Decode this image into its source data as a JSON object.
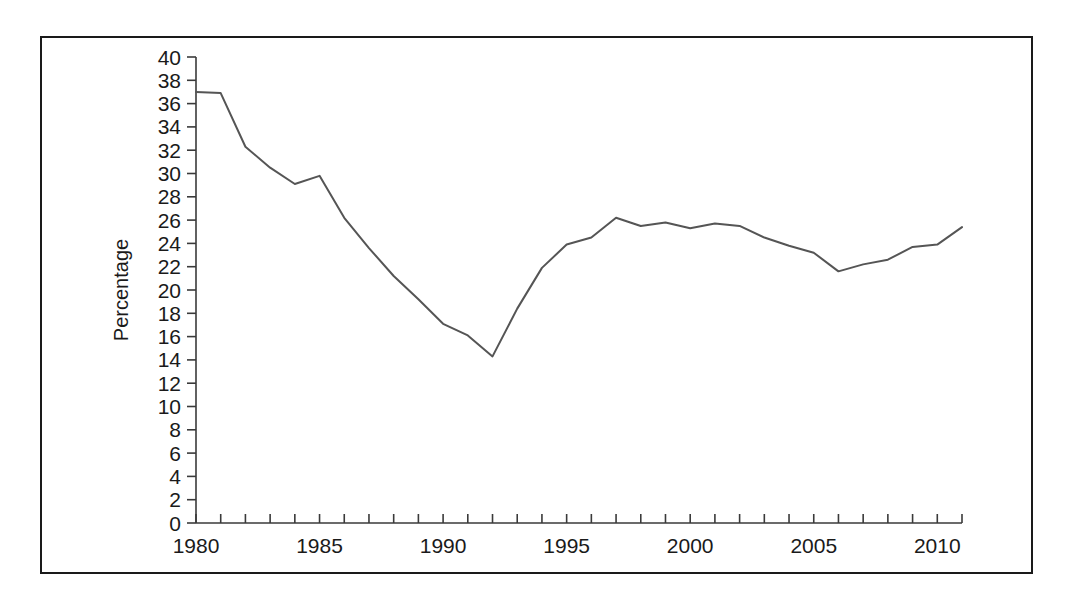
{
  "figure": {
    "background_color": "#ffffff",
    "frame_color": "#1a1a1a",
    "axis_color": "#3a3a3a"
  },
  "chart_data": {
    "type": "line",
    "title": "",
    "subtitle": "",
    "xlabel": "",
    "ylabel": "Percentage",
    "xlim": [
      1980,
      2011
    ],
    "ylim": [
      0,
      40
    ],
    "y_tick_step": 2,
    "x_tick_step": 1,
    "x_label_step": 5,
    "grid": false,
    "legend": false,
    "legend_position": "none",
    "line_color": "#555555",
    "line_width": 2.0,
    "y_ticks": [
      0,
      2,
      4,
      6,
      8,
      10,
      12,
      14,
      16,
      18,
      20,
      22,
      24,
      26,
      28,
      30,
      32,
      34,
      36,
      38,
      40
    ],
    "y_tick_labels": [
      "0",
      "2",
      "4",
      "6",
      "8",
      "10",
      "12",
      "14",
      "16",
      "18",
      "20",
      "22",
      "24",
      "26",
      "28",
      "30",
      "32",
      "34",
      "36",
      "38",
      "40"
    ],
    "x_ticks": [
      1980,
      1981,
      1982,
      1983,
      1984,
      1985,
      1986,
      1987,
      1988,
      1989,
      1990,
      1991,
      1992,
      1993,
      1994,
      1995,
      1996,
      1997,
      1998,
      1999,
      2000,
      2001,
      2002,
      2003,
      2004,
      2005,
      2006,
      2007,
      2008,
      2009,
      2010,
      2011
    ],
    "x_tick_labels": [
      "1980",
      "",
      "",
      "",
      "",
      "1985",
      "",
      "",
      "",
      "",
      "1990",
      "",
      "",
      "",
      "",
      "1995",
      "",
      "",
      "",
      "",
      "2000",
      "",
      "",
      "",
      "",
      "2005",
      "",
      "",
      "",
      "",
      "2010",
      ""
    ],
    "x": [
      1980,
      1981,
      1982,
      1983,
      1984,
      1985,
      1986,
      1987,
      1988,
      1989,
      1990,
      1991,
      1992,
      1993,
      1994,
      1995,
      1996,
      1997,
      1998,
      1999,
      2000,
      2001,
      2002,
      2003,
      2004,
      2005,
      2006,
      2007,
      2008,
      2009,
      2010,
      2011
    ],
    "values": [
      37.0,
      36.9,
      32.3,
      30.5,
      29.1,
      29.8,
      26.2,
      23.6,
      21.2,
      19.2,
      17.1,
      16.1,
      14.3,
      18.4,
      21.9,
      23.9,
      24.5,
      26.2,
      25.5,
      25.8,
      25.3,
      25.7,
      25.5,
      24.5,
      23.8,
      23.2,
      21.6,
      22.2,
      22.6,
      23.7,
      23.9,
      25.4
    ],
    "series": [
      {
        "name": "Percentage",
        "values": [
          37.0,
          36.9,
          32.3,
          30.5,
          29.1,
          29.8,
          26.2,
          23.6,
          21.2,
          19.2,
          17.1,
          16.1,
          14.3,
          18.4,
          21.9,
          23.9,
          24.5,
          26.2,
          25.5,
          25.8,
          25.3,
          25.7,
          25.5,
          24.5,
          23.8,
          23.2,
          21.6,
          22.2,
          22.6,
          23.7,
          23.9,
          25.4
        ]
      }
    ]
  }
}
